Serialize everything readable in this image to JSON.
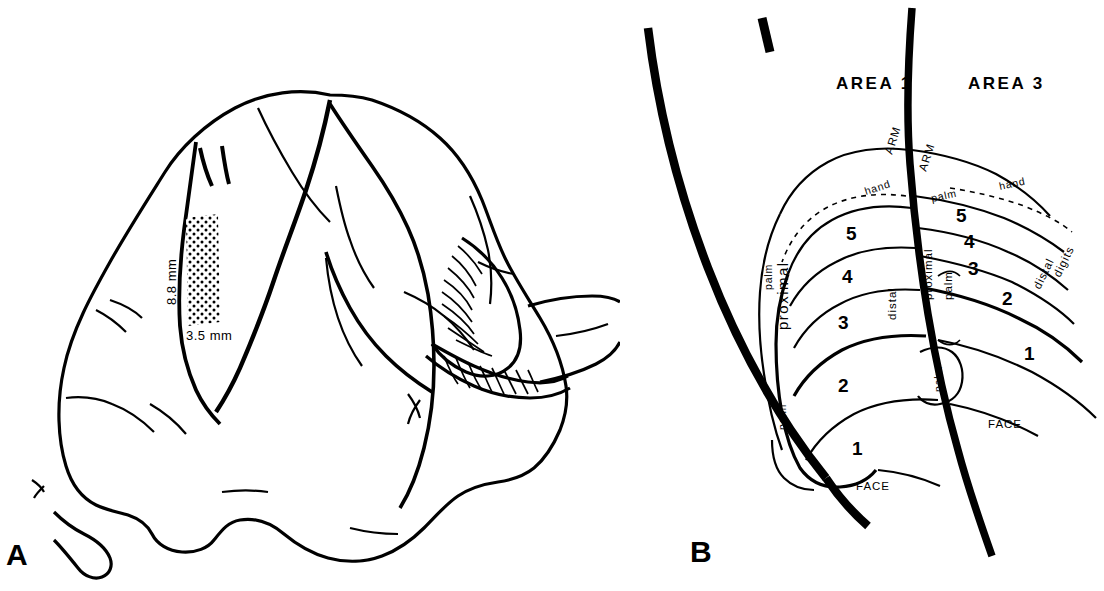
{
  "figure": {
    "panels": [
      {
        "id": "A",
        "label": "A"
      },
      {
        "id": "B",
        "label": "B"
      }
    ]
  },
  "panel_a": {
    "label": "A",
    "description": "lateral view line drawing of a monkey brain with stippled rectangular recording zone on the postcentral gyrus and striated cerebellum",
    "scale_vertical": "8.8 mm",
    "scale_horizontal": "3.5 mm"
  },
  "panel_b": {
    "label": "B",
    "area_left": "AREA 1",
    "area_right": "AREA 3",
    "arm_left": "ARM",
    "arm_right": "ARM",
    "hand_left": "hand",
    "hand_right": "hand",
    "palm_left_hand_line": "palm",
    "palm_right_hand_line": "palm",
    "palm_left_outer": "palm",
    "palm_left_lower": "palm",
    "palm_center": "palm",
    "palm_right_col": "palm",
    "proximal_left": "proximal",
    "distal_left": "distal",
    "proximal_right": "proximal",
    "distal_right": "distal",
    "digits_right": "digits",
    "face_left": "FACE",
    "face_right": "FACE",
    "digits_left_column": [
      "5",
      "4",
      "3",
      "2",
      "1"
    ],
    "digits_right_column": [
      "5",
      "4",
      "3",
      "2",
      "1"
    ]
  },
  "colors": {
    "ink": "#000000",
    "background": "#ffffff"
  }
}
